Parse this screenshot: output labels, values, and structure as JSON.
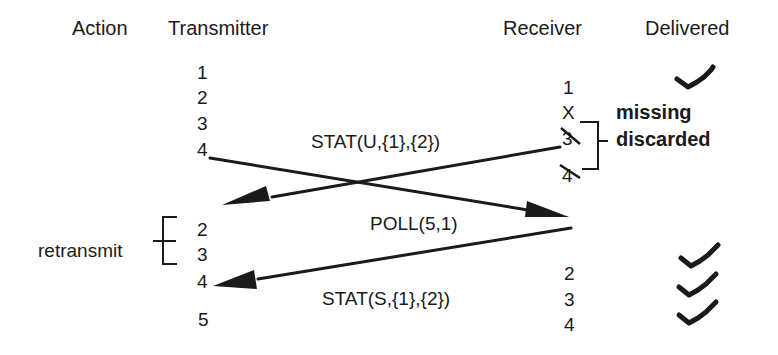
{
  "headers": {
    "action": "Action",
    "transmitter": "Transmitter",
    "receiver": "Receiver",
    "delivered": "Delivered"
  },
  "transmitter": {
    "initial_frames": [
      "1",
      "2",
      "3",
      "4"
    ],
    "retransmit_frames": [
      "2",
      "3",
      "4"
    ],
    "next_frame": "5"
  },
  "receiver": {
    "initial_frames": [
      "1",
      "X",
      "3",
      "4"
    ],
    "later_frames": [
      "2",
      "3",
      "4"
    ],
    "annotation_missing": "missing",
    "annotation_discarded": "discarded"
  },
  "actions": {
    "retransmit": "retransmit"
  },
  "messages": {
    "stat_u": "STAT(U,{1},{2})",
    "poll": "POLL(5,1)",
    "stat_s": "STAT(S,{1},{2})"
  },
  "delivered": {
    "first": "check",
    "later": [
      "check",
      "check",
      "check"
    ]
  },
  "colors": {
    "ink": "#1a1a1a",
    "background": "#ffffff"
  }
}
